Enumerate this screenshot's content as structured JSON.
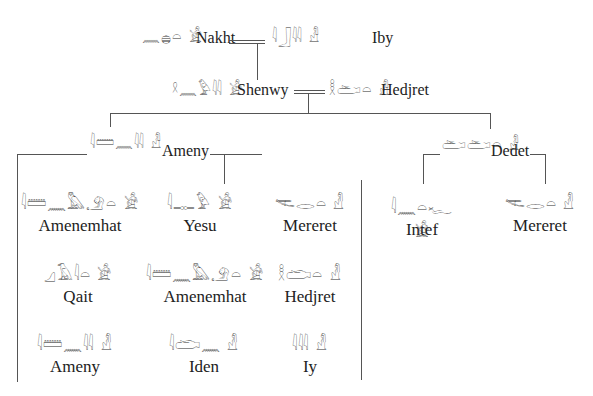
{
  "tree": {
    "generation1": {
      "husband": {
        "name": "Nakht",
        "glyphs": "𓈖𓐍𓏏 𓀀"
      },
      "wife": {
        "name": "Iby",
        "glyphs": "𓇋𓃀𓇌 𓁐"
      }
    },
    "generation2": {
      "husband": {
        "name": "Shenwy",
        "glyphs": "𓍲𓈖𓅱𓇌 𓀀"
      },
      "wife": {
        "name": "Hedjret",
        "glyphs": "𓎛𓂧𓏏 𓁐"
      }
    },
    "generation3": [
      {
        "name": "Ameny",
        "glyphs": "𓇋𓏠𓈖𓇌 𓁐"
      },
      {
        "name": "Dedet",
        "glyphs": "𓂧𓂧𓏏 𓁐"
      }
    ],
    "children_of_ameny": [
      {
        "name": "Amenemhat",
        "glyphs": "𓇋𓏠𓈖𓅓𓄂𓏏 𓀀"
      },
      {
        "name": "Yesu",
        "glyphs": "𓇋𓊃𓅱 𓀀"
      },
      {
        "name": "Mereret",
        "glyphs": "𓌻𓂋𓏏 𓁐"
      },
      {
        "name": "Qait",
        "glyphs": "𓈎𓄿𓇋𓏏 𓀀"
      },
      {
        "name": "Amenemhat",
        "glyphs": "𓇋𓏠𓈖𓅓𓄂𓏏 𓀀"
      },
      {
        "name": "Hedjret",
        "glyphs": "𓎛𓂧𓏏 𓁐"
      },
      {
        "name": "Ameny",
        "glyphs": "𓇋𓏠𓈖𓇌 𓁐"
      },
      {
        "name": "Iden",
        "glyphs": "𓇋𓂧𓈖 𓁐"
      },
      {
        "name": "Iy",
        "glyphs": "𓇋𓇌 𓁐"
      }
    ],
    "children_of_dedet": [
      {
        "name": "Intef",
        "glyphs": "𓇋𓈖𓏏𓆑 𓀀"
      },
      {
        "name": "Mereret",
        "glyphs": "𓌻𓂋𓏏 𓁐"
      }
    ]
  }
}
